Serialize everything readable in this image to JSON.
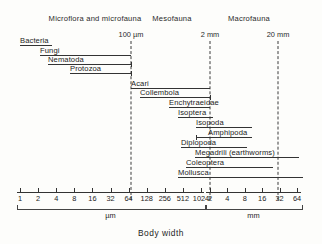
{
  "chart_data": {
    "type": "bar",
    "title": "Body width",
    "subtitle": "",
    "xlabel": "Body width",
    "ylabel": "",
    "orientation": "horizontal",
    "xscale": "log2",
    "xlim": [
      1,
      64000
    ],
    "grid": false,
    "legend_position": "none",
    "x_unit_primary": "µm",
    "x_unit_secondary": "mm",
    "note": "Horizontal range bars show body-width span of soil organism groups on a log2 axis from 1 µm to 64 mm.",
    "axis": {
      "um_ticks": [
        "1",
        "2",
        "4",
        "8",
        "16",
        "32",
        "64",
        "128",
        "256",
        "512",
        "1024"
      ],
      "mm_ticks": [
        "2",
        "4",
        "8",
        "16",
        "32",
        "64"
      ],
      "um_values": [
        1,
        2,
        4,
        8,
        16,
        32,
        64,
        128,
        256,
        512,
        1024
      ],
      "mm_values": [
        2,
        4,
        8,
        16,
        32,
        64
      ],
      "um_brace_label": "µm",
      "mm_brace_label": "mm"
    },
    "groups": [
      {
        "label": "Microflora and microfauna",
        "center_px": 95
      },
      {
        "label": "Mesofauna",
        "center_px": 172
      },
      {
        "label": "Macrofauna",
        "center_px": 249
      }
    ],
    "boundaries": [
      {
        "label": "100 µm",
        "x_px": 131,
        "value_um": 100
      },
      {
        "label": "2 mm",
        "x_px": 210,
        "value_um": 2000
      },
      {
        "label": "20 mm",
        "x_px": 278,
        "value_um": 20000
      }
    ],
    "categories": [
      "Bacteria",
      "Fungi",
      "Nematoda",
      "Protozoa",
      "Acari",
      "Collembola",
      "Enchytraeidae",
      "Isoptera",
      "Isopoda",
      "Amphipoda",
      "Diplopoda",
      "Megadrili (earthworms)",
      "Coleoptera",
      "Mollusca"
    ],
    "taxa": [
      {
        "label": "Bacteria",
        "label_x": 20,
        "bar_x0": 20,
        "bar_x1": 52,
        "y": 44,
        "cap_start": false,
        "cap_end": false
      },
      {
        "label": "Fungi",
        "label_x": 40,
        "bar_x0": 40,
        "bar_x1": 131,
        "y": 54,
        "cap_start": false,
        "cap_end": false
      },
      {
        "label": "Nematoda",
        "label_x": 48,
        "bar_x0": 48,
        "bar_x1": 131,
        "y": 63,
        "cap_start": false,
        "cap_end": true
      },
      {
        "label": "Protozoa",
        "label_x": 70,
        "bar_x0": 70,
        "bar_x1": 131,
        "y": 72,
        "cap_start": false,
        "cap_end": true
      },
      {
        "label": "Acari",
        "label_x": 131,
        "bar_x0": 131,
        "bar_x1": 210,
        "y": 87,
        "cap_start": false,
        "cap_end": false
      },
      {
        "label": "Collembola",
        "label_x": 140,
        "bar_x0": 140,
        "bar_x1": 210,
        "y": 96,
        "cap_start": false,
        "cap_end": true
      },
      {
        "label": "Enchytraeidae",
        "label_x": 169,
        "bar_x0": 169,
        "bar_x1": 210,
        "y": 106,
        "cap_start": false,
        "cap_end": false
      },
      {
        "label": "Isoptera",
        "label_x": 178,
        "bar_x0": 178,
        "bar_x1": 213,
        "y": 116,
        "cap_start": false,
        "cap_end": false
      },
      {
        "label": "Isopoda",
        "label_x": 196,
        "bar_x0": 196,
        "bar_x1": 252,
        "y": 126,
        "cap_start": false,
        "cap_end": false
      },
      {
        "label": "Amphipoda",
        "label_x": 208,
        "bar_x0": 196,
        "bar_x1": 252,
        "y": 136,
        "cap_start": true,
        "cap_end": false
      },
      {
        "label": "Diplopoda",
        "label_x": 181,
        "bar_x0": 181,
        "bar_x1": 247,
        "y": 146,
        "cap_start": false,
        "cap_end": false
      },
      {
        "label": "Megadrili (earthworms)",
        "label_x": 195,
        "bar_x0": 195,
        "bar_x1": 299,
        "y": 156,
        "cap_start": false,
        "cap_end": false
      },
      {
        "label": "Coleoptera",
        "label_x": 186,
        "bar_x0": 186,
        "bar_x1": 273,
        "y": 166,
        "cap_start": false,
        "cap_end": false
      },
      {
        "label": "Mollusca",
        "label_x": 178,
        "bar_x0": 178,
        "bar_x1": 303,
        "y": 176,
        "cap_start": false,
        "cap_end": false
      }
    ]
  }
}
